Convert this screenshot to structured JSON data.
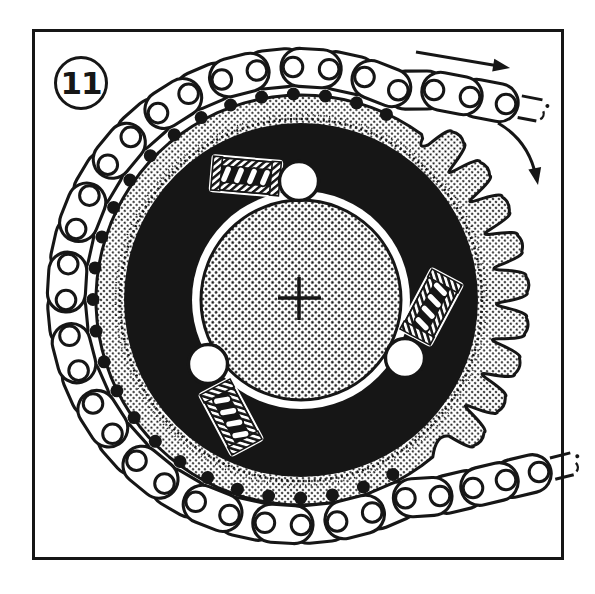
{
  "figure": {
    "label": "11",
    "ink": "#161616",
    "paper": "#ffffff"
  },
  "frame": {
    "x": 33.5,
    "y": 30.5,
    "w": 529,
    "h": 528,
    "stroke_w": 3
  },
  "badge": {
    "cx": 81,
    "cy": 83,
    "r": 25.5,
    "stroke_w": 3,
    "text_y": 94
  },
  "diagram": {
    "center": [
      301,
      300
    ],
    "sprocket": {
      "smooth_r": 205,
      "smooth_from_deg": 54,
      "smooth_to_deg": 313,
      "teeth": {
        "first_deg": 46,
        "count": 9,
        "pitch_deg": 10.5,
        "root_r": 201,
        "tip_r": 226,
        "valley_r": 190
      },
      "ragged_rings": [
        {
          "r": 181,
          "w": 2.6,
          "dash": "2 3.5"
        },
        {
          "r": 185.5,
          "w": 1.8,
          "dash": "1 4.5"
        }
      ]
    },
    "dark_ring": {
      "outer_r": 177
    },
    "hub": {
      "gap_r": 109,
      "r": 100,
      "outline_w": 3
    },
    "cross": {
      "cx": 299,
      "cy": 298,
      "arm_left": 21,
      "arm_right": 22,
      "arm_up": 21,
      "arm_down": 22,
      "stroke_w": 3.6
    },
    "rollers": {
      "r": 19.5,
      "stroke_w": 3.4,
      "positions": [
        [
          299,
          181
        ],
        [
          405,
          358
        ],
        [
          208,
          364
        ]
      ]
    },
    "springs": {
      "length": 70,
      "width": 36,
      "coil_count": 4,
      "placements": [
        {
          "cx": 246,
          "cy": 176,
          "rot": 5
        },
        {
          "cx": 431,
          "cy": 307,
          "rot": 118
        },
        {
          "cx": 231,
          "cy": 417,
          "rot": -118
        }
      ]
    },
    "chain": {
      "center": [
        297,
        296
      ],
      "rx": 231,
      "ry": 229,
      "wrap_start_deg": 64,
      "wrap_end_deg": 298,
      "pitch_deg": 9,
      "plate_w": 38,
      "plate_overhang": 12,
      "plate_stroke_w": 3.1,
      "hole_r": 9.8,
      "hole_stroke_w": 3,
      "top_tail": [
        [
          434,
          90
        ],
        [
          470,
          97
        ],
        [
          506,
          104
        ]
      ],
      "top_break": {
        "at": [
          506,
          104
        ],
        "dir_deg": 11
      },
      "bottom_tail": [
        [
          440,
          496
        ],
        [
          473,
          488
        ],
        [
          506,
          480
        ],
        [
          539,
          472
        ]
      ],
      "bottom_break": {
        "at": [
          539,
          472
        ],
        "dir_deg": -14
      },
      "shadow_dot_r": 6.5,
      "shadow_inset": 27
    },
    "arrows": {
      "chain_travel": {
        "from": [
          416,
          52
        ],
        "to": [
          510,
          68
        ],
        "stroke_w": 3
      },
      "rotation": {
        "from": [
          498,
          123
        ],
        "ctrl": [
          529,
          141
        ],
        "to": [
          536,
          177
        ],
        "stroke_w": 3
      },
      "head_len": 17,
      "head_half_w": 6.5
    }
  }
}
